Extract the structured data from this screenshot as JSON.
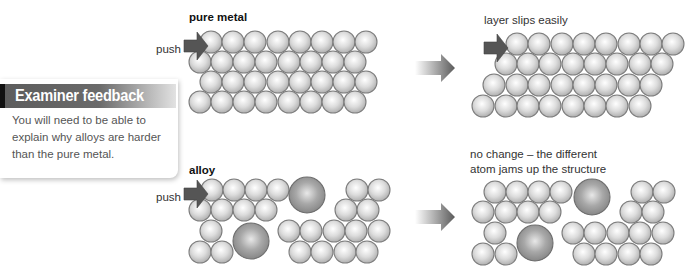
{
  "feedback": {
    "title": "Examiner feedback",
    "body": "You will need to be able to explain why alloys are harder than the pure metal."
  },
  "pure_metal": {
    "title": "pure metal",
    "push_label": "push",
    "result_label": "layer slips easily"
  },
  "alloy": {
    "title": "alloy",
    "push_label": "push",
    "result_label_line1": "no change – the different",
    "result_label_line2": "atom jams up the structure"
  },
  "colors": {
    "atom_small": "#d8d8d8",
    "atom_large": "#9a9a9a",
    "atom_outline": "#7a7a7a",
    "push_arrow": "#555555",
    "transition_arrow": "#6a6a6a",
    "feedback_header": "#5d5d5d"
  },
  "icons": {
    "push_arrow": "right-arrow",
    "transition_arrow": "gradient-right-arrow"
  }
}
